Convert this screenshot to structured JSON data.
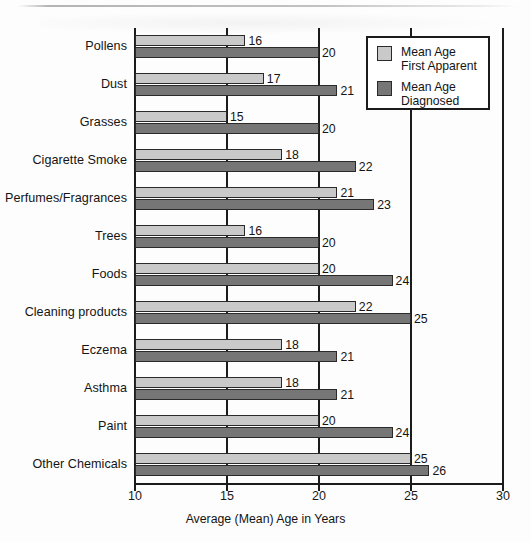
{
  "chart_data": {
    "type": "bar",
    "orientation": "horizontal",
    "title": "",
    "xlabel": "Average (Mean) Age in Years",
    "ylabel": "",
    "xlim": [
      10,
      30
    ],
    "xticks": [
      10,
      15,
      20,
      25,
      30
    ],
    "xtick_labels": [
      "10",
      "15",
      "20",
      "25",
      "30"
    ],
    "grid": true,
    "legend_position": "top-right",
    "categories": [
      "Pollens",
      "Dust",
      "Grasses",
      "Cigarette Smoke",
      "Perfumes/Fragrances",
      "Trees",
      "Foods",
      "Cleaning products",
      "Eczema",
      "Asthma",
      "Paint",
      "Other Chemicals"
    ],
    "series": [
      {
        "name": "Mean Age First Apparent",
        "color": "#c9c9c9",
        "values": [
          16,
          17,
          15,
          18,
          21,
          16,
          20,
          22,
          18,
          18,
          20,
          25
        ]
      },
      {
        "name": "Mean Age Diagnosed",
        "color": "#767676",
        "values": [
          20,
          21,
          20,
          22,
          23,
          20,
          24,
          25,
          21,
          21,
          24,
          26
        ]
      }
    ]
  },
  "legend": {
    "items": [
      {
        "label_line1": "Mean Age",
        "label_line2": "First Apparent",
        "swatch": "light"
      },
      {
        "label_line1": "Mean Age",
        "label_line2": "Diagnosed",
        "swatch": "dark"
      }
    ]
  },
  "axis": {
    "x_title": "Average (Mean) Age in Years"
  }
}
